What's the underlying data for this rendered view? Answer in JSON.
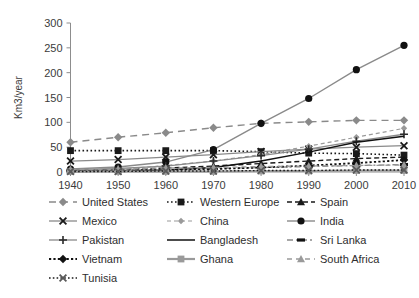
{
  "chart_data": {
    "type": "line",
    "title": "",
    "xlabel": "",
    "ylabel": "Km3/year",
    "x": [
      1940,
      1950,
      1960,
      1970,
      1980,
      1990,
      2000,
      2010
    ],
    "xticklabels": [
      "1940",
      "1950",
      "1960",
      "1970",
      "1980",
      "1990",
      "2000",
      "2010"
    ],
    "yticklabels": [
      "0",
      "50",
      "100",
      "150",
      "200",
      "250",
      "300"
    ],
    "yticks": [
      0,
      50,
      100,
      150,
      200,
      250,
      300
    ],
    "xlim": [
      1940,
      2010
    ],
    "ylim": [
      0,
      300
    ],
    "grid": false,
    "legend_position": "below",
    "legend_columns": 3,
    "series": [
      {
        "name": "United States",
        "values": [
          60,
          70,
          79,
          89,
          98,
          101,
          104,
          104
        ],
        "color": "#8a8a8a",
        "marker": "diamond",
        "marker_color": "#8a8a8a",
        "dash": "7,5",
        "width": 1.4
      },
      {
        "name": "Western Europe",
        "values": [
          43,
          43,
          43,
          43,
          41,
          38,
          37,
          34
        ],
        "color": "#1a1a1a",
        "marker": "square",
        "marker_color": "#1a1a1a",
        "dash": "1.6,2.4",
        "width": 1.6
      },
      {
        "name": "Spain",
        "values": [
          3,
          5,
          8,
          12,
          17,
          22,
          27,
          30
        ],
        "color": "#1a1a1a",
        "marker": "triangle",
        "marker_color": "#1a1a1a",
        "dash": "5,3",
        "width": 1.4
      },
      {
        "name": "Mexico",
        "values": [
          22,
          25,
          30,
          35,
          41,
          46,
          50,
          53
        ],
        "color": "#8a8a8a",
        "marker": "x",
        "marker_color": "#1a1a1a",
        "dash": "none",
        "width": 1.3
      },
      {
        "name": "China",
        "values": [
          2,
          5,
          13,
          22,
          35,
          52,
          70,
          88
        ],
        "color": "#9a9a9a",
        "marker": "smalldiamond",
        "marker_color": "#9a9a9a",
        "dash": "4,3",
        "width": 1.2
      },
      {
        "name": "India",
        "values": [
          6,
          10,
          20,
          45,
          98,
          148,
          206,
          255
        ],
        "color": "#8a8a8a",
        "marker": "circle",
        "marker_color": "#111111",
        "dash": "none",
        "width": 1.4
      },
      {
        "name": "Pakistan",
        "values": [
          4,
          7,
          12,
          22,
          33,
          46,
          62,
          76
        ],
        "color": "#8a8a8a",
        "marker": "plus",
        "marker_color": "#2b2b2b",
        "dash": "none",
        "width": 1.3
      },
      {
        "name": "Bangladesh",
        "values": [
          1,
          2,
          4,
          9,
          22,
          40,
          60,
          72
        ],
        "color": "#111111",
        "marker": "none",
        "marker_color": "#111111",
        "dash": "none",
        "width": 1.5
      },
      {
        "name": "Sri Lanka",
        "values": [
          2,
          3,
          5,
          7,
          9,
          11,
          13,
          15
        ],
        "color": "#8a8a8a",
        "marker": "dash",
        "marker_color": "#111111",
        "dash": "6,3,2,3",
        "width": 1.4
      },
      {
        "name": "Vietnam",
        "values": [
          2,
          3,
          4,
          6,
          9,
          13,
          18,
          24
        ],
        "color": "#111111",
        "marker": "diamond",
        "marker_color": "#111111",
        "dash": "2.2,2.2",
        "width": 1.8
      },
      {
        "name": "Ghana",
        "values": [
          1,
          1,
          1,
          1,
          2,
          2,
          3,
          3
        ],
        "color": "#9a9a9a",
        "marker": "square",
        "marker_color": "#9a9a9a",
        "dash": "none",
        "width": 2.2
      },
      {
        "name": "South Africa",
        "values": [
          5,
          6,
          8,
          9,
          11,
          12,
          13,
          14
        ],
        "color": "#9a9a9a",
        "marker": "triangle",
        "marker_color": "#9a9a9a",
        "dash": "5,4",
        "width": 1.3
      },
      {
        "name": "Tunisia",
        "values": [
          1,
          1,
          2,
          2,
          3,
          3,
          4,
          4
        ],
        "color": "#1a1a1a",
        "marker": "x",
        "marker_color": "#5a5a5a",
        "dash": "1.6,2.2",
        "width": 1.4
      }
    ]
  }
}
